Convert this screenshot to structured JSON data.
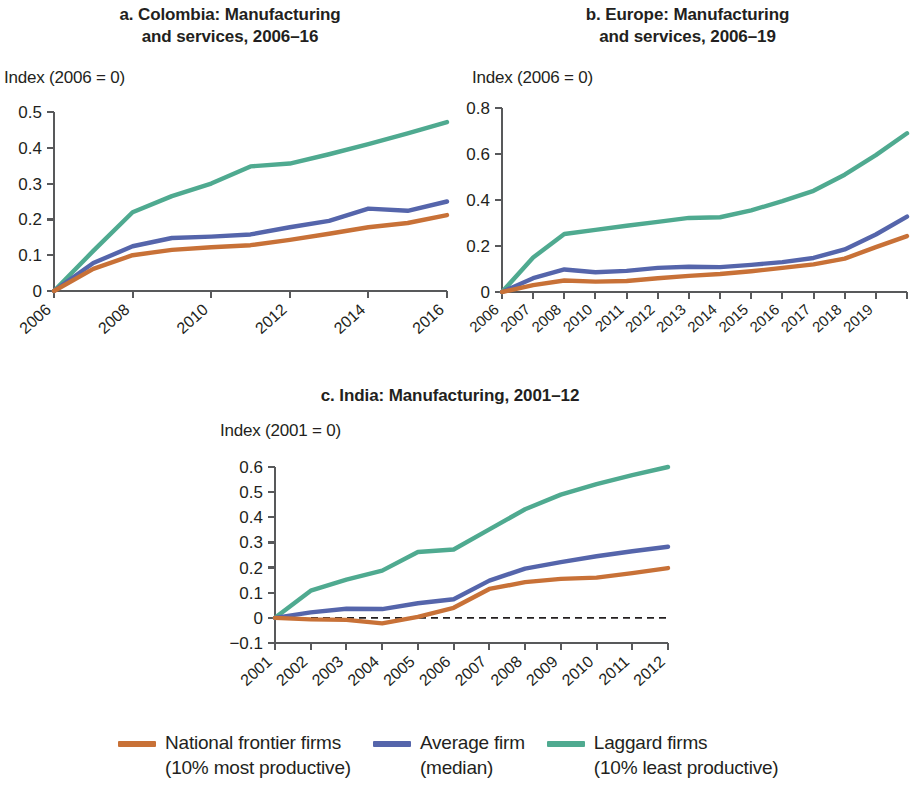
{
  "series_colors": {
    "frontier": "#c87137",
    "average": "#5565ab",
    "laggard": "#4faa90"
  },
  "legend": {
    "items": [
      {
        "name": "frontier",
        "label": "National frontier firms",
        "sublabel": "(10% most productive)",
        "color": "#c87137"
      },
      {
        "name": "average",
        "label": "Average firm",
        "sublabel": "(median)",
        "color": "#5565ab"
      },
      {
        "name": "laggard",
        "label": "Laggard firms",
        "sublabel": "(10% least productive)",
        "color": "#4faa90"
      }
    ]
  },
  "panels": {
    "a": {
      "title_line1": "a. Colombia: Manufacturing",
      "title_line2": "and services, 2006–16",
      "axis_note": "Index (2006 = 0)"
    },
    "b": {
      "title_line1": "b. Europe: Manufacturing",
      "title_line2": "and services, 2006–19",
      "axis_note": "Index (2006 = 0)"
    },
    "c": {
      "title_line1": "c. India: Manufacturing, 2001–12",
      "title_line2": "",
      "axis_note": "Index (2001 = 0)"
    }
  },
  "chart_data": [
    {
      "id": "a",
      "type": "line",
      "title": "a. Colombia: Manufacturing and services, 2006–16",
      "xlabel": "",
      "ylabel": "Index (2006 = 0)",
      "x": [
        2006,
        2007,
        2008,
        2009,
        2010,
        2011,
        2012,
        2013,
        2014,
        2015,
        2016
      ],
      "xtick_labels": [
        "2006",
        "2008",
        "2010",
        "2012",
        "2014",
        "2016"
      ],
      "xtick_values": [
        2006,
        2008,
        2010,
        2012,
        2014,
        2016
      ],
      "ytick_labels": [
        "0",
        "0.1",
        "0.2",
        "0.3",
        "0.4",
        "0.5"
      ],
      "ytick_values": [
        0,
        0.1,
        0.2,
        0.3,
        0.4,
        0.5
      ],
      "ylim": [
        0,
        0.5
      ],
      "xlim": [
        2006,
        2016
      ],
      "grid": false,
      "zero_line": false,
      "legend_position": "bottom",
      "series": [
        {
          "name": "National frontier firms (10% most productive)",
          "key": "frontier",
          "color": "#c87137",
          "values": [
            0,
            0.062,
            0.1,
            0.115,
            0.122,
            0.128,
            0.143,
            0.16,
            0.178,
            0.19,
            0.212
          ]
        },
        {
          "name": "Average firm (median)",
          "key": "average",
          "color": "#5565ab",
          "values": [
            0,
            0.078,
            0.125,
            0.148,
            0.152,
            0.158,
            0.178,
            0.196,
            0.23,
            0.224,
            0.25
          ]
        },
        {
          "name": "Laggard firms (10% least productive)",
          "key": "laggard",
          "color": "#4faa90",
          "values": [
            0,
            0.112,
            0.22,
            0.265,
            0.3,
            0.348,
            0.356,
            0.382,
            0.41,
            0.44,
            0.472
          ]
        }
      ]
    },
    {
      "id": "b",
      "type": "line",
      "title": "b. Europe: Manufacturing and services, 2006–19",
      "xlabel": "",
      "ylabel": "Index (2006 = 0)",
      "x": [
        2006,
        2007,
        2008,
        2009,
        2010,
        2011,
        2012,
        2013,
        2014,
        2015,
        2016,
        2017,
        2018,
        2019
      ],
      "xtick_labels": [
        "2006",
        "2007",
        "2008",
        "2010",
        "2011",
        "2012",
        "2013",
        "2014",
        "2015",
        "2016",
        "2017",
        "2018",
        "2019"
      ],
      "ytick_labels": [
        "0",
        "0.2",
        "0.4",
        "0.6",
        "0.8"
      ],
      "ytick_values": [
        0,
        0.2,
        0.4,
        0.6,
        0.8
      ],
      "ylim": [
        0,
        0.8
      ],
      "grid": false,
      "zero_line": false,
      "legend_position": "bottom",
      "series": [
        {
          "name": "National frontier firms (10% most productive)",
          "key": "frontier",
          "color": "#c87137",
          "values": [
            0,
            0.03,
            0.05,
            0.045,
            0.048,
            0.06,
            0.07,
            0.078,
            0.09,
            0.105,
            0.12,
            0.145,
            0.195,
            0.243
          ]
        },
        {
          "name": "Average firm (median)",
          "key": "average",
          "color": "#5565ab",
          "values": [
            0,
            0.06,
            0.098,
            0.086,
            0.092,
            0.105,
            0.11,
            0.108,
            0.118,
            0.13,
            0.148,
            0.185,
            0.25,
            0.328
          ]
        },
        {
          "name": "Laggard firms (10% least productive)",
          "key": "laggard",
          "color": "#4faa90",
          "values": [
            0,
            0.15,
            0.252,
            0.27,
            0.288,
            0.305,
            0.322,
            0.325,
            0.355,
            0.395,
            0.44,
            0.51,
            0.595,
            0.69
          ]
        }
      ]
    },
    {
      "id": "c",
      "type": "line",
      "title": "c. India: Manufacturing, 2001–12",
      "xlabel": "",
      "ylabel": "Index (2001 = 0)",
      "x": [
        2001,
        2002,
        2003,
        2004,
        2005,
        2006,
        2007,
        2008,
        2009,
        2010,
        2011,
        2012
      ],
      "xtick_labels": [
        "2001",
        "2002",
        "2003",
        "2004",
        "2005",
        "2006",
        "2007",
        "2008",
        "2009",
        "2010",
        "2011",
        "2012"
      ],
      "ytick_labels": [
        "−0.1",
        "0",
        "0.1",
        "0.2",
        "0.3",
        "0.4",
        "0.5",
        "0.6"
      ],
      "ytick_values": [
        -0.1,
        0,
        0.1,
        0.2,
        0.3,
        0.4,
        0.5,
        0.6
      ],
      "ylim": [
        -0.1,
        0.6
      ],
      "grid": false,
      "zero_line": true,
      "legend_position": "bottom",
      "series": [
        {
          "name": "National frontier firms (10% most productive)",
          "key": "frontier",
          "color": "#c87137",
          "values": [
            0,
            -0.006,
            -0.008,
            -0.022,
            0.004,
            0.04,
            0.115,
            0.142,
            0.155,
            0.16,
            0.178,
            0.198
          ]
        },
        {
          "name": "Average firm (median)",
          "key": "average",
          "color": "#5565ab",
          "values": [
            0,
            0.022,
            0.036,
            0.035,
            0.058,
            0.074,
            0.148,
            0.196,
            0.222,
            0.245,
            0.265,
            0.283
          ]
        },
        {
          "name": "Laggard firms (10% least productive)",
          "key": "laggard",
          "color": "#4faa90",
          "values": [
            0,
            0.108,
            0.152,
            0.188,
            0.262,
            0.272,
            0.352,
            0.432,
            0.49,
            0.532,
            0.568,
            0.6
          ]
        }
      ]
    }
  ]
}
